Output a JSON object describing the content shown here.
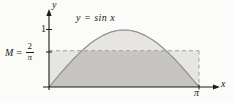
{
  "labels": {
    "y_axis": "y",
    "x_axis": "x",
    "curve": "y = sin x",
    "tick_one": "1",
    "tick_pi": "π",
    "m_prefix": "M =",
    "m_frac_numerator": "2",
    "m_frac_denominator": "π"
  },
  "colors": {
    "background": "#fbfbf9",
    "region_light": "#e6e5e1",
    "region_overlap_dark": "#c6c5c1",
    "curve_stroke": "#8f8f8b",
    "dashed_line": "#a3a29e",
    "axis": "#1a1a1a",
    "text": "#1a1a1a"
  },
  "chart_data": {
    "type": "line",
    "title": "",
    "xlabel": "x",
    "ylabel": "y",
    "function": "y = sin x",
    "x_range": [
      0,
      3.14159265
    ],
    "ylim": [
      0,
      1.15
    ],
    "xlim": [
      0,
      3.6
    ],
    "grid": false,
    "x_ticks": [
      {
        "value": 3.14159265,
        "label": "π"
      }
    ],
    "y_ticks": [
      {
        "value": 1,
        "label": "1"
      },
      {
        "value": 0.63662,
        "label": "M = 2/π"
      }
    ],
    "M_value": 0.63662,
    "M_meaning": "mean value of sin x over [0, π] = 2/π",
    "dashed_rectangle": {
      "x0": 0,
      "x1": 3.14159265,
      "y0": 0,
      "y1": 0.63662
    },
    "series": [
      {
        "name": "y = sin x",
        "points": [
          [
            0,
            0
          ],
          [
            0.3927,
            0.3827
          ],
          [
            0.7854,
            0.7071
          ],
          [
            1.1781,
            0.9239
          ],
          [
            1.5708,
            1.0
          ],
          [
            1.9635,
            0.9239
          ],
          [
            2.3562,
            0.7071
          ],
          [
            2.7489,
            0.3827
          ],
          [
            3.1416,
            0
          ]
        ]
      }
    ],
    "shaded_regions": [
      {
        "name": "area-under-curve",
        "bound": "0 <= y <= sin x, 0 <= x <= π",
        "shade": "light"
      },
      {
        "name": "mean-rectangle",
        "bound": "0 <= y <= 2/π, 0 <= x <= π",
        "shade": "light"
      },
      {
        "name": "overlap",
        "bound": "under both curve and M line",
        "shade": "dark"
      }
    ]
  }
}
